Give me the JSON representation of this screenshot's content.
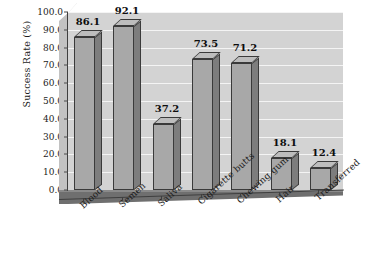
{
  "chart_data": {
    "type": "bar",
    "title": "",
    "subtitle": "",
    "xlabel": "",
    "ylabel": "Success Rate (%)",
    "categories": [
      "Blood",
      "Semen",
      "Saliva",
      "Cigarette butts",
      "Chewing gum",
      "Hair",
      "Transferred"
    ],
    "values": [
      86.1,
      92.1,
      37.2,
      73.5,
      71.2,
      18.1,
      12.4
    ],
    "data_labels": [
      "86.1",
      "92.1",
      "37.2",
      "73.5",
      "71.2",
      "18.1",
      "12.4"
    ],
    "ylim": [
      0,
      100
    ],
    "ytick_step": 10,
    "ytick_labels": [
      "0.0",
      "10.0",
      "20.0",
      "30.0",
      "40.0",
      "50.0",
      "60.0",
      "70.0",
      "80.0",
      "90.0",
      "100.0"
    ],
    "ytick_values": [
      0,
      10,
      20,
      30,
      40,
      50,
      60,
      70,
      80,
      90,
      100
    ],
    "grid": true,
    "grid_orientation": "horizontal",
    "legend": null,
    "legend_position": "none",
    "style": "3d-column",
    "colors": {
      "plot_background": "#d3d3d3",
      "gridline": "#f4f4f4",
      "bar_front": "#a8a8a8",
      "bar_side": "#7d7d7d",
      "bar_top": "#bdbdbd",
      "bar_edge": "#3a3a3a",
      "floor": "#6f6f6f",
      "axis": "#3f3f3f",
      "text": "#1c1c1c",
      "figure_background": "#ffffff"
    }
  }
}
